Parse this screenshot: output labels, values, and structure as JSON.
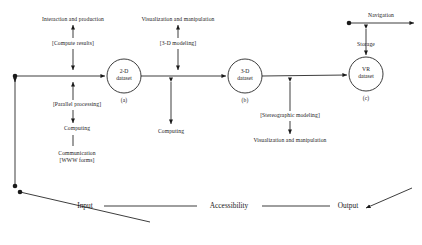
{
  "diagram": {
    "nodes": [
      {
        "id": "node-2d",
        "line1": "2-D",
        "line2": "dataset",
        "caption": "(a)",
        "cx": 124,
        "cy": 76,
        "r": 17
      },
      {
        "id": "node-3d",
        "line1": "3-D",
        "line2": "dataset",
        "caption": "(b)",
        "cx": 245,
        "cy": 76,
        "r": 17
      },
      {
        "id": "node-vr",
        "line1": "VR",
        "line2": "dataset",
        "caption": "(c)",
        "cx": 366,
        "cy": 74,
        "r": 17
      }
    ],
    "top_labels": [
      {
        "id": "interaction-and-production",
        "text": "Interaction and production",
        "x": 73,
        "y": 16
      },
      {
        "id": "compute-results",
        "text": "[Compute results]",
        "x": 73,
        "y": 40
      },
      {
        "id": "visualization-and-manipulation-top",
        "text": "Visualization and manipulation",
        "x": 178,
        "y": 16
      },
      {
        "id": "three-d-modeling",
        "text": "[3-D modeling]",
        "x": 178,
        "y": 40
      },
      {
        "id": "navigation",
        "text": "Navigation",
        "x": 381,
        "y": 12
      },
      {
        "id": "storage",
        "text": "Storage",
        "x": 366,
        "y": 41
      }
    ],
    "bottom_labels": [
      {
        "id": "parallel-processing",
        "text": "[Parallel processing]",
        "x": 77,
        "y": 104
      },
      {
        "id": "computing-left",
        "text": "Computing",
        "x": 77,
        "y": 128
      },
      {
        "id": "communication-www",
        "line1": "Communication",
        "line2": "[WWW forms]",
        "x": 77,
        "y": 153
      },
      {
        "id": "computing-middle",
        "text": "Computing",
        "x": 171,
        "y": 131
      },
      {
        "id": "stereographic-modeling",
        "text": "[Stereographic modeling]",
        "x": 290,
        "y": 115
      },
      {
        "id": "visualization-and-manipulation-bottom",
        "text": "Visualization and manipulation",
        "x": 290,
        "y": 140
      }
    ],
    "axis_labels": [
      {
        "id": "input",
        "text": "Input",
        "x": 85,
        "y": 203
      },
      {
        "id": "accessibility",
        "text": "Accessibility",
        "x": 229,
        "y": 203
      },
      {
        "id": "output",
        "text": "Output",
        "x": 348,
        "y": 203
      }
    ]
  }
}
